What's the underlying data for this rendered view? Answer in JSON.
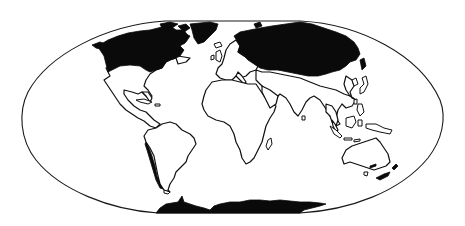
{
  "map": {
    "projection_shape": "flat-polar rounded world outline",
    "colors": {
      "background": "#ffffff",
      "outline": "#1a1a1a",
      "land_fill": "#ffffff",
      "highlight_fill": "#0a0a0a"
    },
    "highlighted_regions": [
      "Canada",
      "Russia",
      "Antarctica",
      "Chile (coast)"
    ],
    "outlined_regions": [
      "United States",
      "Mexico",
      "Central America",
      "South America",
      "Greenland",
      "Europe",
      "Africa",
      "Middle East",
      "South Asia",
      "Southeast Asia",
      "Indonesia",
      "Australia",
      "New Zealand",
      "Japan"
    ]
  }
}
